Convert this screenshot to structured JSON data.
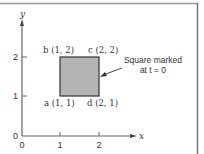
{
  "diagram": {
    "axes": {
      "x_label": "x",
      "y_label": "y",
      "x_ticks": [
        "0",
        "1",
        "2"
      ],
      "y_ticks": [
        "0",
        "1",
        "2"
      ]
    },
    "square": {
      "fill": "#b4b4b4",
      "stroke": "#333333",
      "corners": [
        {
          "label": "b (1, 2)",
          "x": 1,
          "y": 2
        },
        {
          "label": "c (2, 2)",
          "x": 2,
          "y": 2
        },
        {
          "label": "a (1, 1)",
          "x": 1,
          "y": 1
        },
        {
          "label": "d (2, 1)",
          "x": 2,
          "y": 1
        }
      ]
    },
    "annotation": {
      "line1": "Square marked",
      "line2": "at t = 0"
    }
  }
}
